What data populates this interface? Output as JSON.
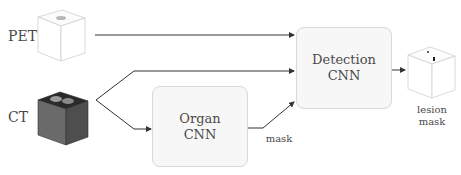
{
  "inputs": {
    "pet": {
      "label": "PET"
    },
    "ct": {
      "label": "CT"
    }
  },
  "blocks": {
    "organ_cnn": {
      "line1": "Organ",
      "line2": "CNN"
    },
    "detection_cnn": {
      "line1": "Detection",
      "line2": "CNN"
    }
  },
  "edges": {
    "mask_label": "mask"
  },
  "output": {
    "line1": "lesion",
    "line2": "mask"
  },
  "colors": {
    "line": "#333333",
    "box_fill": "#f7f7f7",
    "box_border": "#d8d8d8",
    "ct_cube": "#5a5a5a"
  }
}
